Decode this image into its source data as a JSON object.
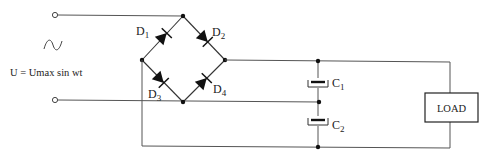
{
  "source": {
    "symbol": "ac-sine-icon",
    "equation": "U = Umax sin wt"
  },
  "diodes": [
    {
      "name": "D",
      "sub": "1"
    },
    {
      "name": "D",
      "sub": "2"
    },
    {
      "name": "D",
      "sub": "3"
    },
    {
      "name": "D",
      "sub": "4"
    }
  ],
  "capacitors": [
    {
      "name": "C",
      "sub": "1"
    },
    {
      "name": "C",
      "sub": "2"
    }
  ],
  "load": {
    "label": "LOAD"
  },
  "colors": {
    "wire": "#555555",
    "component": "#111111",
    "background": "#ffffff"
  }
}
